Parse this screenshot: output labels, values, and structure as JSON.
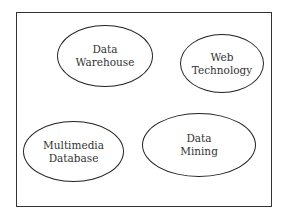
{
  "diagram": {
    "nodes": [
      {
        "id": "data-warehouse",
        "lines": [
          "Data",
          "Warehouse"
        ]
      },
      {
        "id": "web-technology",
        "lines": [
          "Web",
          "Technology"
        ]
      },
      {
        "id": "multimedia-database",
        "lines": [
          "Multimedia",
          "Database"
        ]
      },
      {
        "id": "data-mining",
        "lines": [
          "Data",
          "Mining"
        ]
      }
    ],
    "colors": {
      "stroke": "#222222",
      "text": "#333333",
      "background": "#ffffff"
    }
  }
}
